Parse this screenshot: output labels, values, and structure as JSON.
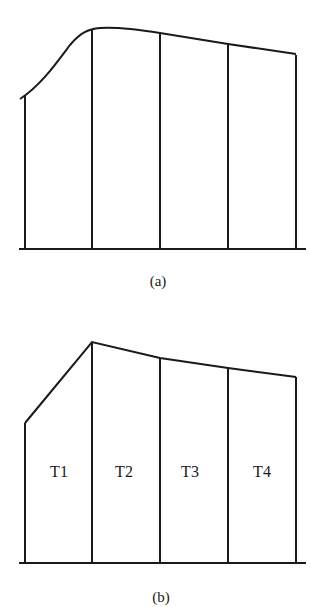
{
  "figure_a": {
    "caption": "(a)",
    "description": "Smooth curved top profile over four vertical segments"
  },
  "figure_b": {
    "caption": "(b)",
    "description": "Piecewise linear top profile over four labeled segments",
    "segments": [
      {
        "label": "T1"
      },
      {
        "label": "T2"
      },
      {
        "label": "T3"
      },
      {
        "label": "T4"
      }
    ]
  },
  "colors": {
    "line": "#1a1a1a",
    "background": "#ffffff"
  }
}
